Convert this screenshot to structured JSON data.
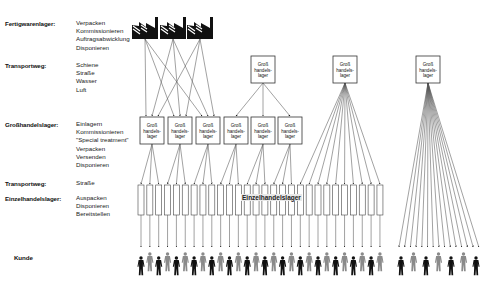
{
  "legend": [
    {
      "label": "Fertigwarenlager:",
      "items": [
        "Verpacken",
        "Kommissionieren",
        "Auftragsabwicklung",
        "Disponieren"
      ]
    },
    {
      "label": "Transportweg:",
      "items": [
        "Schiene",
        "Straße",
        "Wasser",
        "Luft"
      ]
    },
    {
      "label": "Großhandelslager:",
      "items": [
        "Einlagern",
        "Kommissionieren",
        "\"Special treatment\"",
        "Verpacken",
        "Versenden",
        "Disponieren"
      ]
    },
    {
      "label": "Transportweg:",
      "items": [
        "Straße"
      ]
    },
    {
      "label": "Einzelhandelslager:",
      "items": [
        "Auspacken",
        "Disponieren",
        "Bereitstellen"
      ]
    },
    {
      "label": "Kunde",
      "items": []
    }
  ],
  "diagram": {
    "factory_icon": "factory-icon",
    "factory_count": 3,
    "wholesale_box_label": "Groß-handels-lager",
    "wholesale_box_lines": [
      "Groß",
      "handels-",
      "lager"
    ],
    "retail_label": "Einzelhandelslager",
    "customer_icon": "person-icon",
    "colors": {
      "dark": "#111111",
      "gray": "#8a8a8a",
      "line": "#555555"
    }
  }
}
